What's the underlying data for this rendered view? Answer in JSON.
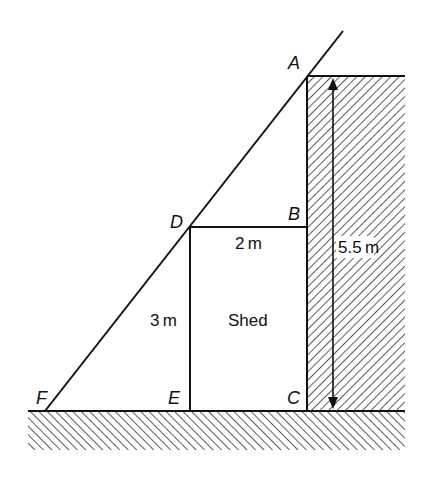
{
  "diagram": {
    "type": "geometry-similar-triangles",
    "colors": {
      "stroke": "#111111",
      "hatch": "#333333",
      "background": "#ffffff"
    },
    "points": {
      "A": {
        "label": "A",
        "x": 307,
        "y": 76
      },
      "B": {
        "label": "B",
        "x": 307,
        "y": 227
      },
      "C": {
        "label": "C",
        "x": 307,
        "y": 411
      },
      "D": {
        "label": "D",
        "x": 190,
        "y": 227
      },
      "E": {
        "label": "E",
        "x": 190,
        "y": 411
      },
      "F": {
        "label": "F",
        "x": 45,
        "y": 411
      }
    },
    "measurements": {
      "db": "2 m",
      "de": "3 m",
      "ac": "5.5 m"
    },
    "objects": {
      "shed": "Shed"
    },
    "regions": {
      "wall": {
        "description": "hatched wall",
        "x1": 307,
        "y1": 76,
        "x2": 405,
        "y2": 411
      },
      "ground": {
        "description": "hatched ground",
        "x1": 28,
        "y1": 411,
        "x2": 405,
        "y2": 450
      }
    }
  }
}
